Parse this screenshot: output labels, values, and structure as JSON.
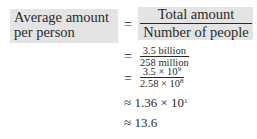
{
  "equation": {
    "lhs": {
      "line1": "Average amount",
      "line2": "per person"
    },
    "step1": {
      "relation": "=",
      "numerator": "Total amount",
      "denominator": "Number of people"
    },
    "step2": {
      "relation": "=",
      "numerator": "3.5 billion",
      "denominator": "258 million"
    },
    "step3": {
      "relation": "=",
      "numerator": {
        "mantissa": "3.5 × 10",
        "exponent": "9"
      },
      "denominator": {
        "mantissa": "2.58 × 10",
        "exponent": "8"
      }
    },
    "step4": {
      "relation": "≈",
      "mantissa": "1.36 × 10",
      "exponent": "1"
    },
    "step5": {
      "relation": "≈",
      "value": "13.6"
    }
  },
  "colors": {
    "highlight": "#e4e4e4",
    "text": "#2a2a2a"
  }
}
